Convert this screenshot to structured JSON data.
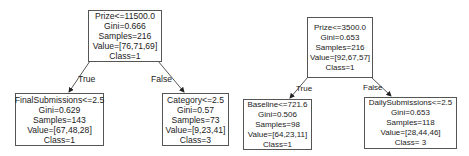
{
  "trees": [
    {
      "root": {
        "split": "Prize<=11500.0",
        "gini": "Gini=0.666",
        "samples": "Samples=216",
        "value": "Value=[76,71,69]",
        "class": "Class=1"
      },
      "left": {
        "edge_label": "True",
        "split": "FinalSubmissions<=2.5",
        "gini": "Gini=0.629",
        "samples": "Samples=143",
        "value": "Value=[67,48,28]",
        "class": "Class=1"
      },
      "right": {
        "edge_label": "False",
        "split": "Category<=2.5",
        "gini": "Gini=0.57",
        "samples": "Samples=73",
        "value": "Value=[9,23,41]",
        "class": "Class=3"
      }
    },
    {
      "root": {
        "split": "Prize<=3500.0",
        "gini": "Gini=0.653",
        "samples": "Samples=216",
        "value": "Value=[92,67,57]",
        "class": "Class=1"
      },
      "left": {
        "edge_label": "True",
        "split": "Baseline<=721.6",
        "gini": "Gini=0.506",
        "samples": "Samples=98",
        "value": "Value=[64,23,11]",
        "class": "Class=1"
      },
      "right": {
        "edge_label": "False",
        "split": "DailySubmissions<=2.5",
        "gini": "Gini=0.653",
        "samples": "Samples=118",
        "value": "Value=[28,44,46]",
        "class": "Class= 3"
      }
    }
  ]
}
